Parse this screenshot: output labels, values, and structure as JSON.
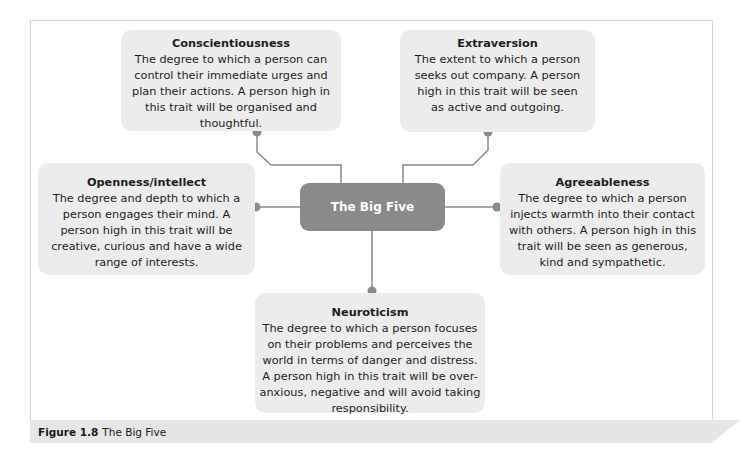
{
  "center": {
    "label": "The Big Five"
  },
  "traits": [
    {
      "id": "conscientiousness",
      "title": "Conscientiousness",
      "desc": "The degree to which a person can control their immediate urges and plan their actions. A person high in this trait will be organised and thoughtful."
    },
    {
      "id": "extraversion",
      "title": "Extraversion",
      "desc": "The extent to which a person seeks out company. A person high in this trait will be seen as active and outgoing."
    },
    {
      "id": "openness",
      "title": "Openness/intellect",
      "desc": "The degree and depth to which a person engages their mind. A person high in this trait will be creative, curious and have a wide range of interests."
    },
    {
      "id": "agreeableness",
      "title": "Agreeableness",
      "desc": "The degree to which a person injects warmth into their contact with others. A person high in this trait will be seen as generous, kind and sympathetic."
    },
    {
      "id": "neuroticism",
      "title": "Neuroticism",
      "desc": "The degree to which a person focuses on their problems and perceives the world in terms of danger and distress. A person high in this trait will be over-anxious, negative and will avoid taking responsibility."
    }
  ],
  "caption": {
    "label": "Figure 1.8",
    "text": "The Big Five"
  },
  "colors": {
    "card": "#ececec",
    "center": "#8a8a8a",
    "connector": "#8a8a8a",
    "caption_bg": "#e6e6e6"
  }
}
